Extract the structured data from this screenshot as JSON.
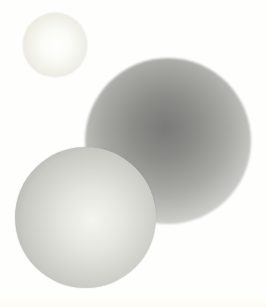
{
  "scene": {
    "description": "Three shaded spheres on a white background",
    "background_color": "#fefefc",
    "spheres": [
      {
        "name": "small-light-sphere",
        "center": [
          55,
          45
        ],
        "radius": 32,
        "tone": "very light, almost white"
      },
      {
        "name": "large-dark-sphere",
        "center": [
          168,
          141
        ],
        "radius": 83,
        "tone": "soft-edged gray, darker center"
      },
      {
        "name": "front-light-sphere",
        "center": [
          85,
          218
        ],
        "radius": 70,
        "tone": "light gray with bright highlight"
      }
    ]
  }
}
